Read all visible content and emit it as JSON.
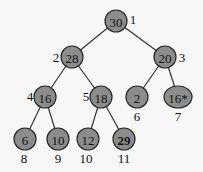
{
  "diagram": {
    "type": "binary-heap-tree",
    "nodes": [
      {
        "index": "1",
        "value": "30",
        "x": 116,
        "y": 21,
        "label_x": 133,
        "label_y": 19
      },
      {
        "index": "2",
        "value": "28",
        "x": 72,
        "y": 57,
        "label_x": 56,
        "label_y": 57
      },
      {
        "index": "3",
        "value": "20",
        "x": 165,
        "y": 57,
        "label_x": 182,
        "label_y": 57
      },
      {
        "index": "4",
        "value": "16",
        "x": 45,
        "y": 97,
        "label_x": 30,
        "label_y": 96
      },
      {
        "index": "5",
        "value": "18",
        "x": 101,
        "y": 97,
        "label_x": 86,
        "label_y": 96
      },
      {
        "index": "6",
        "value": "2",
        "x": 137,
        "y": 97,
        "label_x": 137,
        "label_y": 116
      },
      {
        "index": "7",
        "value": "16*",
        "x": 178,
        "y": 97,
        "label_x": 178,
        "label_y": 116
      },
      {
        "index": "8",
        "value": "6",
        "x": 25,
        "y": 139,
        "label_x": 24,
        "label_y": 158
      },
      {
        "index": "9",
        "value": "10",
        "x": 58,
        "y": 139,
        "label_x": 58,
        "label_y": 158
      },
      {
        "index": "10",
        "value": "12",
        "x": 88,
        "y": 139,
        "label_x": 86,
        "label_y": 158
      },
      {
        "index": "11",
        "value": "29",
        "x": 124,
        "y": 139,
        "label_x": 124,
        "label_y": 158,
        "bold": true
      }
    ],
    "edges": [
      [
        "1",
        "2"
      ],
      [
        "1",
        "3"
      ],
      [
        "2",
        "4"
      ],
      [
        "2",
        "5"
      ],
      [
        "3",
        "6"
      ],
      [
        "3",
        "7"
      ],
      [
        "4",
        "8"
      ],
      [
        "4",
        "9"
      ],
      [
        "5",
        "10"
      ],
      [
        "5",
        "11"
      ]
    ],
    "colors": {
      "node_fill": "#8c8c8c",
      "node_stroke": "#2a2a2a",
      "edge": "#333333",
      "background": "#f7f7f7"
    }
  }
}
